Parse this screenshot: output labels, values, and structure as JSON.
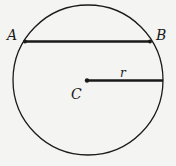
{
  "diagram": {
    "type": "circle-with-chord-and-radius",
    "circle": {
      "cx": 88,
      "cy": 80,
      "r": 75
    },
    "labels": {
      "point_a": "A",
      "point_b": "B",
      "center": "C",
      "radius": "r"
    },
    "chord": {
      "from": "A",
      "to": "B"
    },
    "radius_segment": {
      "from": "C",
      "to": "circle-right"
    },
    "colors": {
      "line": "#1a1a1a",
      "background": "#f4f4f2"
    }
  }
}
